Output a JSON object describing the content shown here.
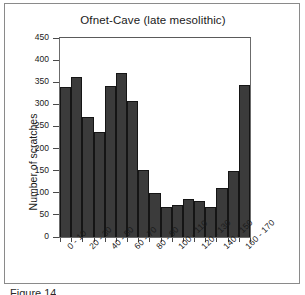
{
  "figure": {
    "caption_partial": "Figure 14"
  },
  "chart_data": {
    "type": "bar",
    "title": "Ofnet-Cave (late mesolithic)",
    "xlabel": "",
    "ylabel": "Number of scratches",
    "ylim": [
      0,
      450
    ],
    "ytick_labels": [
      "0",
      "50",
      "100",
      "150",
      "200",
      "250",
      "300",
      "350",
      "400",
      "450"
    ],
    "ytick_values": [
      0,
      50,
      100,
      150,
      200,
      250,
      300,
      350,
      400,
      450
    ],
    "grid": false,
    "legend": null,
    "bar_color": "#3b3b3b",
    "bar_edge_color": "#151515",
    "categories": [
      "0 - 10",
      "10 - 20",
      "20 - 30",
      "30 - 40",
      "40 - 50",
      "50 - 60",
      "60 - 70",
      "70 - 80",
      "80 - 90",
      "90 - 100",
      "100 - 110",
      "110 - 120",
      "120 - 130",
      "130 - 140",
      "140 - 150",
      "150 - 160",
      "160 - 170"
    ],
    "visible_tick_labels": [
      "0 - 10",
      "20 - 30",
      "40 - 50",
      "60 - 70",
      "80 - 90",
      "100 - 110",
      "120 - 130",
      "140 - 150",
      "160 - 170"
    ],
    "values": [
      340,
      362,
      272,
      238,
      342,
      372,
      307,
      152,
      99,
      69,
      72,
      86,
      81,
      67,
      110,
      149,
      344
    ]
  }
}
